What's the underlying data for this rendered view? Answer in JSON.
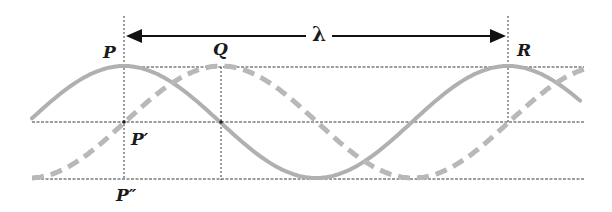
{
  "diagram": {
    "labels": {
      "P": "P",
      "Q": "Q",
      "R": "R",
      "P_prime": "P′",
      "P_double_prime": "P″",
      "wavelength": "λ"
    },
    "colors": {
      "wave": "#b0b0b0",
      "gridline": "#3a3a3a",
      "arrow": "#111111",
      "text": "#1a1a1a",
      "background": "#ffffff"
    },
    "geometry": {
      "x_P": 124,
      "x_Q": 221,
      "x_R": 508,
      "y_top": 67,
      "y_mid": 122,
      "y_bottom": 179,
      "y_arrow": 36,
      "wavelength_px": 384,
      "amplitude_px": 56
    },
    "waves": [
      {
        "name": "solid-wave",
        "style": "solid",
        "phase_offset": "0",
        "peak_at": "P"
      },
      {
        "name": "dashed-wave",
        "style": "dashed",
        "phase_offset": "λ/4",
        "peak_at": "Q"
      }
    ]
  }
}
